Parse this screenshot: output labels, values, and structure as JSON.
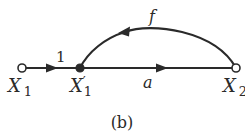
{
  "diagram": {
    "type": "signal-flow-graph",
    "caption": "(b)",
    "nodes": [
      {
        "id": "X1",
        "label_main": "X",
        "label_sub": "1",
        "label_prime": "",
        "style": "open"
      },
      {
        "id": "X1p",
        "label_main": "X",
        "label_sub": "1",
        "label_prime": "′",
        "style": "filled"
      },
      {
        "id": "X2",
        "label_main": "X",
        "label_sub": "2",
        "label_prime": "",
        "style": "open"
      }
    ],
    "edges": [
      {
        "from": "X1",
        "to": "X1p",
        "gain": "1"
      },
      {
        "from": "X1p",
        "to": "X2",
        "gain": "a"
      },
      {
        "from": "X2",
        "to": "X1p",
        "gain": "f"
      }
    ],
    "colors": {
      "line": "#2a2a2a",
      "background": "#ffffff"
    }
  }
}
